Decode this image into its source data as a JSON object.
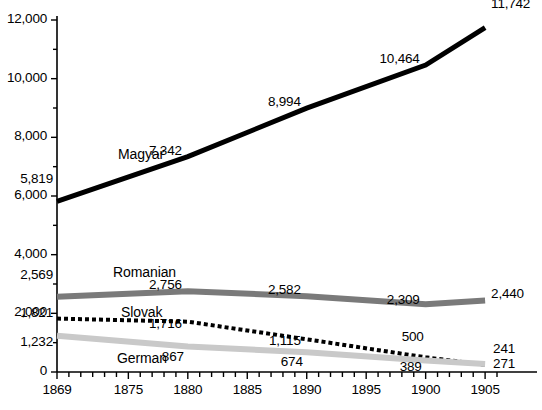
{
  "chart_data": {
    "type": "line",
    "title": "",
    "subtitle": "",
    "xlabel": "",
    "ylabel": "",
    "x": [
      1869,
      1880,
      1890,
      1900,
      1905
    ],
    "xlim": [
      1869,
      1906
    ],
    "ylim": [
      0,
      12000
    ],
    "grid": false,
    "legend_position": "inline-labels",
    "x_tick_labels": [
      "1869",
      "1875",
      "1880",
      "1885",
      "1890",
      "1895",
      "1900",
      "1905"
    ],
    "x_tick_values": [
      1869,
      1875,
      1880,
      1885,
      1890,
      1895,
      1900,
      1905
    ],
    "x_minor_tick_step": 1,
    "y_tick_labels": [
      "0",
      "2,000",
      "4,000",
      "6,000",
      "8,000",
      "10,000",
      "12,000"
    ],
    "y_tick_values": [
      0,
      2000,
      4000,
      6000,
      8000,
      10000,
      12000
    ],
    "y_minor_tick_step": 1000,
    "series": [
      {
        "name": "Magyar",
        "color": "#000000",
        "style": "solid",
        "width": 5,
        "values": [
          5819,
          7342,
          8994,
          10464,
          11742
        ],
        "value_labels": [
          "5,819",
          "7,342",
          "8,994",
          "10,464",
          "11,742"
        ]
      },
      {
        "name": "Romanian",
        "color": "#7a7a7a",
        "style": "solid",
        "width": 6,
        "values": [
          2569,
          2756,
          2582,
          2309,
          2440
        ],
        "value_labels": [
          "2,569",
          "2,756",
          "2,582",
          "2,309",
          "2,440"
        ]
      },
      {
        "name": "Slovak",
        "color": "#000000",
        "style": "dotted",
        "width": 4,
        "values": [
          1821,
          1716,
          1115,
          500,
          241
        ],
        "value_labels": [
          "1,821",
          "1,716",
          "1,115",
          "500",
          "241"
        ]
      },
      {
        "name": "German",
        "color": "#c9c9c9",
        "style": "solid",
        "width": 6,
        "values": [
          1232,
          867,
          674,
          389,
          271
        ],
        "value_labels": [
          "1,232",
          "867",
          "674",
          "389",
          "271"
        ]
      }
    ]
  },
  "axis": {
    "line_color": "#000000",
    "origin_label": "0"
  }
}
